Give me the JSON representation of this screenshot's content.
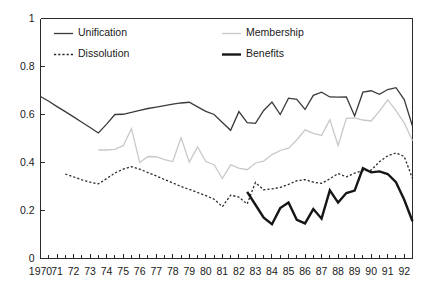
{
  "chart_data": {
    "type": "line",
    "title": "",
    "subtitle": "",
    "xlabel": "",
    "ylabel": "",
    "xlim": [
      1970,
      1992.5
    ],
    "ylim": [
      0,
      1
    ],
    "grid": false,
    "legend_position": "top-inside",
    "y_ticks": [
      0,
      0.2,
      0.4,
      0.6,
      0.8,
      1
    ],
    "y_tick_labels": [
      "0",
      "0.2",
      "0.4",
      "0.6",
      "0.8",
      "1"
    ],
    "x_ticks": [
      1970,
      1971,
      1972,
      1973,
      1974,
      1975,
      1976,
      1977,
      1978,
      1979,
      1980,
      1981,
      1982,
      1983,
      1984,
      1985,
      1986,
      1987,
      1988,
      1989,
      1990,
      1991,
      1992
    ],
    "x_tick_labels": [
      "1970",
      "71",
      "72",
      "73",
      "74",
      "75",
      "76",
      "77",
      "78",
      "79",
      "80",
      "81",
      "82",
      "83",
      "84",
      "85",
      "86",
      "87",
      "88",
      "89",
      "90",
      "91",
      "92"
    ],
    "x_minor_tick_interval": 0.5,
    "series": [
      {
        "name": "Unification",
        "style": "solid",
        "color": "#3a3a3a",
        "width": 1.3,
        "x": [
          1970.0,
          1970.5,
          1971.0,
          1971.5,
          1972.0,
          1972.5,
          1973.0,
          1973.5,
          1974.0,
          1974.5,
          1975.0,
          1975.5,
          1976.0,
          1976.5,
          1977.0,
          1977.5,
          1978.0,
          1978.5,
          1979.0,
          1979.5,
          1980.0,
          1980.5,
          1981.0,
          1981.5,
          1982.0,
          1982.5,
          1983.0,
          1983.5,
          1984.0,
          1984.5,
          1985.0,
          1985.5,
          1986.0,
          1986.5,
          1987.0,
          1987.5,
          1988.0,
          1988.5,
          1989.0,
          1989.5,
          1990.0,
          1990.5,
          1991.0,
          1991.5,
          1992.0,
          1992.5
        ],
        "values": [
          0.675,
          0.655,
          0.633,
          0.612,
          0.59,
          0.568,
          0.546,
          0.523,
          0.56,
          0.6,
          0.601,
          0.609,
          0.617,
          0.625,
          0.631,
          0.637,
          0.643,
          0.648,
          0.651,
          0.632,
          0.613,
          0.6,
          0.567,
          0.534,
          0.612,
          0.566,
          0.563,
          0.617,
          0.652,
          0.6,
          0.668,
          0.663,
          0.621,
          0.68,
          0.693,
          0.673,
          0.672,
          0.673,
          0.594,
          0.693,
          0.699,
          0.684,
          0.704,
          0.712,
          0.662,
          0.551
        ]
      },
      {
        "name": "Dissolution",
        "style": "dotted",
        "color": "#2b2b2b",
        "width": 1.3,
        "x": [
          1971.5,
          1972.0,
          1972.5,
          1973.0,
          1973.5,
          1974.0,
          1974.5,
          1975.0,
          1975.5,
          1976.0,
          1976.5,
          1977.0,
          1977.5,
          1978.0,
          1978.5,
          1979.0,
          1979.5,
          1980.0,
          1980.5,
          1981.0,
          1981.5,
          1982.0,
          1982.5,
          1983.0,
          1983.5,
          1984.0,
          1984.5,
          1985.0,
          1985.5,
          1986.0,
          1986.5,
          1987.0,
          1987.5,
          1988.0,
          1988.5,
          1989.0,
          1989.5,
          1990.0,
          1990.5,
          1991.0,
          1991.5,
          1992.0,
          1992.5
        ],
        "values": [
          0.352,
          0.34,
          0.328,
          0.318,
          0.311,
          0.333,
          0.356,
          0.372,
          0.383,
          0.372,
          0.358,
          0.344,
          0.329,
          0.315,
          0.3,
          0.288,
          0.275,
          0.262,
          0.247,
          0.216,
          0.264,
          0.256,
          0.227,
          0.317,
          0.286,
          0.29,
          0.296,
          0.309,
          0.324,
          0.329,
          0.318,
          0.313,
          0.332,
          0.354,
          0.34,
          0.356,
          0.366,
          0.368,
          0.403,
          0.428,
          0.44,
          0.425,
          0.333
        ]
      },
      {
        "name": "Membership",
        "style": "solid",
        "color": "#c9c9c9",
        "width": 1.3,
        "x": [
          1973.5,
          1974.0,
          1974.5,
          1975.0,
          1975.5,
          1976.0,
          1976.5,
          1977.0,
          1977.5,
          1978.0,
          1978.5,
          1979.0,
          1979.5,
          1980.0,
          1980.5,
          1981.0,
          1981.5,
          1982.0,
          1982.5,
          1983.0,
          1983.5,
          1984.0,
          1984.5,
          1985.0,
          1985.5,
          1986.0,
          1986.5,
          1987.0,
          1987.5,
          1988.0,
          1988.5,
          1989.0,
          1989.5,
          1990.0,
          1990.5,
          1991.0,
          1991.5,
          1992.0,
          1992.5
        ],
        "values": [
          0.452,
          0.452,
          0.455,
          0.47,
          0.541,
          0.4,
          0.425,
          0.424,
          0.412,
          0.404,
          0.503,
          0.402,
          0.465,
          0.404,
          0.391,
          0.333,
          0.39,
          0.377,
          0.37,
          0.398,
          0.406,
          0.433,
          0.45,
          0.46,
          0.494,
          0.536,
          0.521,
          0.513,
          0.578,
          0.471,
          0.584,
          0.586,
          0.577,
          0.573,
          0.614,
          0.661,
          0.616,
          0.565,
          0.491
        ]
      },
      {
        "name": "Benefits",
        "style": "solid",
        "color": "#161616",
        "width": 2.4,
        "x": [
          1982.5,
          1983.0,
          1983.5,
          1984.0,
          1984.5,
          1985.0,
          1985.5,
          1986.0,
          1986.5,
          1987.0,
          1987.5,
          1988.0,
          1988.5,
          1989.0,
          1989.5,
          1990.0,
          1990.5,
          1991.0,
          1991.5,
          1992.0,
          1992.5
        ],
        "values": [
          0.278,
          0.224,
          0.17,
          0.143,
          0.21,
          0.233,
          0.161,
          0.146,
          0.206,
          0.166,
          0.284,
          0.233,
          0.273,
          0.283,
          0.376,
          0.359,
          0.363,
          0.352,
          0.318,
          0.245,
          0.155
        ]
      }
    ],
    "legend": [
      {
        "label": "Unification",
        "style": "solid",
        "color": "#3a3a3a",
        "width": 1.3
      },
      {
        "label": "Dissolution",
        "style": "dotted",
        "color": "#2b2b2b",
        "width": 1.3
      },
      {
        "label": "Membership",
        "style": "solid",
        "color": "#c9c9c9",
        "width": 1.3
      },
      {
        "label": "Benefits",
        "style": "solid",
        "color": "#161616",
        "width": 2.4
      }
    ]
  }
}
